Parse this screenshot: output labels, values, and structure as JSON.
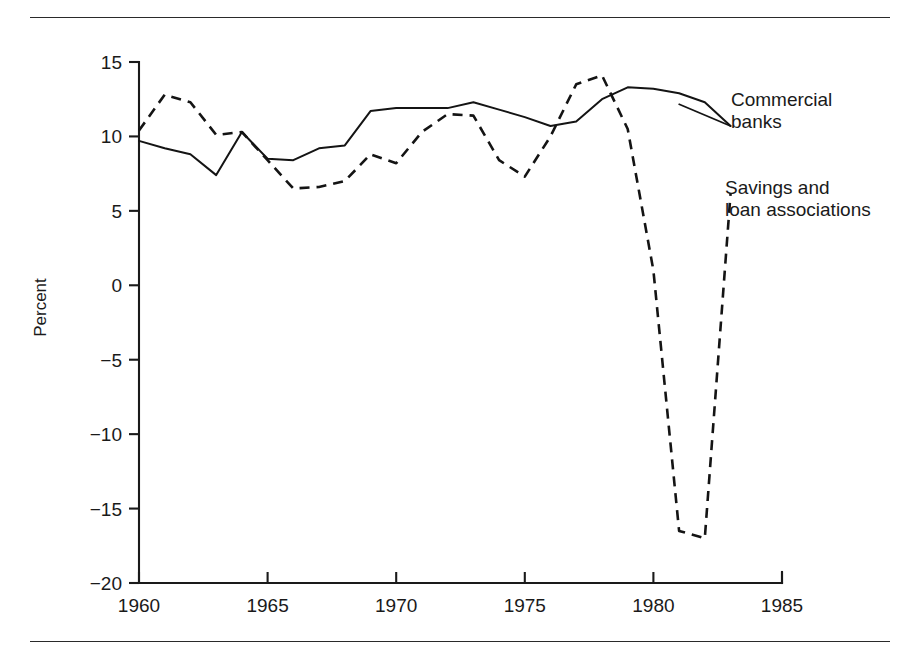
{
  "figure": {
    "top_rule": "horizontal-rule",
    "bottom_rule": "horizontal-rule"
  },
  "chart_data": {
    "type": "line",
    "title": "",
    "xlabel": "",
    "ylabel": "Percent",
    "xlim": [
      1960,
      1985
    ],
    "ylim": [
      -20,
      15
    ],
    "grid": false,
    "legend_position": "inline-annotations",
    "x_ticks": [
      "1960",
      "1965",
      "1970",
      "1975",
      "1980",
      "1985"
    ],
    "x_tick_values": [
      1960,
      1965,
      1970,
      1975,
      1980,
      1985
    ],
    "y_ticks": [
      "15",
      "10",
      "5",
      "0",
      "−5",
      "−10",
      "−15",
      "−20"
    ],
    "y_tick_values": [
      15,
      10,
      5,
      0,
      -5,
      -10,
      -15,
      -20
    ],
    "series": [
      {
        "name": "Commercial banks",
        "style": "solid",
        "label_text": "Commercial\nbanks",
        "x": [
          1960,
          1961,
          1962,
          1963,
          1964,
          1965,
          1966,
          1967,
          1968,
          1969,
          1970,
          1971,
          1972,
          1973,
          1974,
          1975,
          1976,
          1977,
          1978,
          1979,
          1980,
          1981,
          1982,
          1983
        ],
        "values": [
          9.7,
          9.2,
          8.8,
          7.4,
          10.3,
          8.5,
          8.4,
          9.2,
          9.4,
          11.7,
          11.9,
          11.9,
          11.9,
          12.3,
          11.8,
          11.3,
          10.7,
          11.0,
          12.5,
          13.3,
          13.2,
          12.9,
          12.3,
          10.7
        ]
      },
      {
        "name": "Savings and loan associations",
        "style": "dashed",
        "label_text": "Savings and\nloan associations",
        "x": [
          1960,
          1961,
          1962,
          1963,
          1964,
          1965,
          1966,
          1967,
          1968,
          1969,
          1970,
          1971,
          1972,
          1973,
          1974,
          1975,
          1976,
          1977,
          1978,
          1979,
          1980,
          1981,
          1982,
          1983
        ],
        "values": [
          10.4,
          12.8,
          12.3,
          10.1,
          10.3,
          8.4,
          6.5,
          6.6,
          7.0,
          8.8,
          8.2,
          10.3,
          11.5,
          11.4,
          8.4,
          7.3,
          10.0,
          13.5,
          14.1,
          10.5,
          1.0,
          -16.5,
          -17.0,
          6.2
        ]
      }
    ],
    "annotations": [
      {
        "name": "commercial-banks-label",
        "text": "Commercial\nbanks"
      },
      {
        "name": "savings-loan-label",
        "text": "Savings and\nloan associations"
      }
    ]
  }
}
